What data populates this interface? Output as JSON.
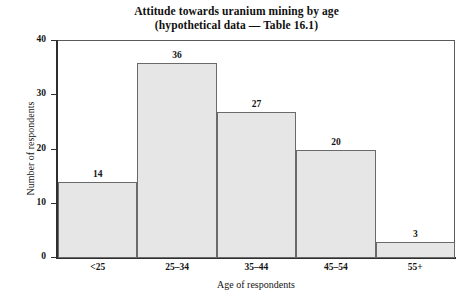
{
  "chart_data": {
    "type": "bar",
    "title": "Attitude towards uranium mining by age",
    "subtitle": "(hypothetical data — Table 16.1)",
    "categories": [
      "<25",
      "25–34",
      "35–44",
      "45–54",
      "55+"
    ],
    "values": [
      14,
      36,
      27,
      20,
      3
    ],
    "data_labels": [
      "14",
      "36",
      "27",
      "20",
      "3"
    ],
    "xlabel": "Age of respondents",
    "ylabel": "Number of respondents",
    "ylim": [
      0,
      40
    ],
    "yticks": [
      0,
      10,
      20,
      30,
      40
    ],
    "ytick_labels": [
      "0",
      "10",
      "20",
      "30",
      "40"
    ],
    "grid": false,
    "legend": null,
    "bar_fill_color": "#e6e6e6",
    "bar_edge_color": "#6a6a6a",
    "axis_color": "#2e2e2e",
    "background_color": "#ffffff",
    "bar_gap": 0
  }
}
